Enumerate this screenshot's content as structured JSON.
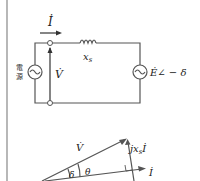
{
  "circuit": {
    "current_label": "İ",
    "reactance_label": "x",
    "reactance_sub": "s",
    "voltage_label": "V̇",
    "source_label_line1": "電",
    "source_label_line2": "源",
    "emf_label": "Ė∠ − δ"
  },
  "phasor": {
    "voltage_label": "V̇",
    "drop_label": "jx",
    "drop_sub": "s",
    "drop_current": "İ",
    "current_label": "İ",
    "delta_label": "δ",
    "theta_label": "θ"
  },
  "colors": {
    "line": "#555555",
    "text": "#222222"
  }
}
